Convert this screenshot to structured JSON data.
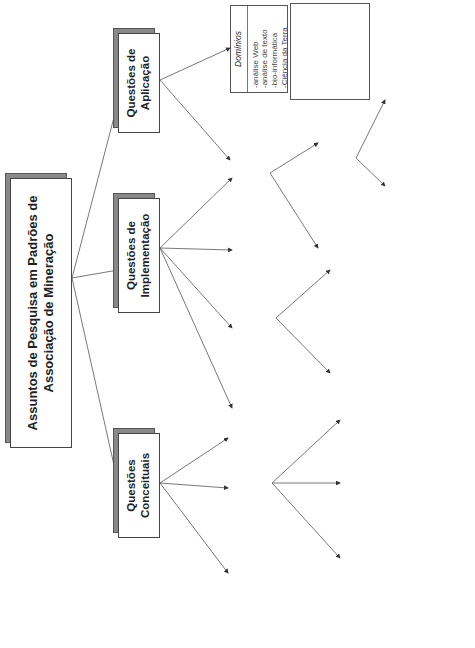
{
  "root": {
    "label": "Assuntos de Pesquisa em Padrões de Associação de Mineração"
  },
  "application": {
    "label": "Questões de Aplicação",
    "domains": {
      "title": "Domínios",
      "items": [
        "análise Web",
        "análise de texto",
        "bio-informática",
        "Ciência da Terra"
      ]
    },
    "other": {
      "title": "Outros problemas de mineração de dados",
      "items": [
        "classificação",
        "regressão",
        "agrupamento",
        "sistemas de recomendador"
      ]
    }
  },
  "implementation": {
    "label": "Questões de Implementação",
    "db": {
      "title": "Questões de bancos de dados",
      "items": [
        "Otimização",
        "Suporte SQL",
        "OLAP",
        "multi banco de dados"
      ]
    },
    "discovery": {
      "label": "Descoberta de Padrões",
      "model": {
        "title": "Modelo Computacional",
        "items": [
          "serial ou paralela",
          "online ou em lote"
        ]
      },
      "algo": {
        "title": "Algoritmo e Estrutura de Dados",
        "items": [
          "Apriori",
          "DIC",
          "projeção de árvore",
          "árvore FP",
          "H-mine",
          "Partição",
          "Baseado em amostras",
          "CHARM"
        ]
      }
    },
    "constraints": {
      "title": "Restrições",
      "items": [
        "taxonomia de itens",
        "baseada em modelos",
        "múltiplo suporte"
      ]
    },
    "post": {
      "label": "Pós-processamento",
      "visualization": {
        "label": "Visualização"
      },
      "interest": {
        "label": "Interesse",
        "measure": {
          "title": "Medida",
          "items": [
            "objetiva",
            "subjetiva"
          ]
        },
        "method": {
          "title": "Método",
          "items": [
            "classificação",
            "filtragem",
            "resumo"
          ]
        }
      }
    }
  },
  "conceptual": {
    "label": "Questões Conceituais",
    "formulation": {
      "title": "Formulação Teórica",
      "items": [
        "teoria da rede",
        "limites da enumeração de conjuntos de itens"
      ]
    },
    "patterns": {
      "label": "Tipo de Padrões",
      "rules": {
        "title": "Regras",
        "items": [
          "negativo",
          "dependência",
          "causal",
          "com pesos",
          "padrões espaciais e de co-localização (cíclicos, sequenciais)",
          "difusi",
          "regras de exceção"
        ]
      },
      "itemsets": {
        "title": "Conjuntos de itens",
        "items": [
          "fechado",
          "máximo",
          "padrões emergentes",
          "hyperclique patterns",
          "envelope de suporte"
        ]
      },
      "structures": {
        "title": "Outras Estruturas",
        "items": [
          "sub-árvores",
          "sub-grafos"
        ]
      }
    },
    "datatype": {
      "title": "Tipo de Dados",
      "items": [
        "binário",
        "numérico",
        "nominal",
        "ordinal",
        "misturado"
      ]
    }
  },
  "colors": {
    "line": "#555555",
    "shadow": "#888888",
    "border": "#444444"
  }
}
